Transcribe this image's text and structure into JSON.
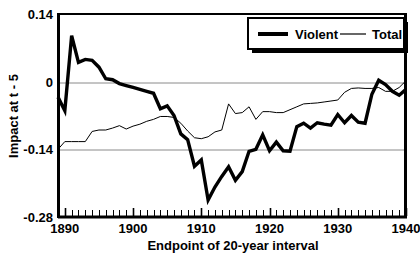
{
  "chart_data": {
    "type": "line",
    "title": "",
    "xlabel": "Endpoint of 20-year interval",
    "ylabel": "Impact at t - 5",
    "xlim": [
      1889,
      1940
    ],
    "ylim": [
      -0.28,
      0.14
    ],
    "xticks": [
      1890,
      1900,
      1910,
      1920,
      1930,
      1940
    ],
    "xtick_labels": [
      "1890",
      "1900",
      "1910",
      "1920",
      "1930",
      "1940"
    ],
    "yticks": [
      0.14,
      0,
      -0.14,
      -0.28
    ],
    "ytick_labels": [
      "0.14",
      "0",
      "-0.14",
      "-0.28"
    ],
    "minor_xtick_step": 1,
    "grid": "horizontal-gridlines-at-0-and--0.14",
    "legend": {
      "position": "top-right",
      "entries": [
        {
          "name": "Violent",
          "style": "thick-black-line",
          "color": "#000000",
          "width": 3.4
        },
        {
          "name": "Total",
          "style": "thin-black-line",
          "color": "#000000",
          "width": 1.0
        }
      ]
    },
    "x": [
      1889,
      1890,
      1891,
      1892,
      1893,
      1894,
      1895,
      1896,
      1897,
      1898,
      1899,
      1900,
      1901,
      1902,
      1903,
      1904,
      1905,
      1906,
      1907,
      1908,
      1909,
      1910,
      1911,
      1912,
      1913,
      1914,
      1915,
      1916,
      1917,
      1918,
      1919,
      1920,
      1921,
      1922,
      1923,
      1924,
      1925,
      1926,
      1927,
      1928,
      1929,
      1930,
      1931,
      1932,
      1933,
      1934,
      1935,
      1936,
      1937,
      1938,
      1939,
      1940
    ],
    "series": [
      {
        "name": "Violent",
        "values": [
          -0.032,
          -0.06,
          0.095,
          0.04,
          0.046,
          0.044,
          0.03,
          0.006,
          0.004,
          -0.004,
          -0.008,
          -0.012,
          -0.016,
          -0.02,
          -0.024,
          -0.056,
          -0.05,
          -0.07,
          -0.108,
          -0.12,
          -0.175,
          -0.162,
          -0.245,
          -0.218,
          -0.196,
          -0.176,
          -0.204,
          -0.186,
          -0.144,
          -0.14,
          -0.11,
          -0.143,
          -0.125,
          -0.143,
          -0.144,
          -0.093,
          -0.086,
          -0.096,
          -0.085,
          -0.088,
          -0.09,
          -0.068,
          -0.085,
          -0.07,
          -0.084,
          -0.086,
          -0.026,
          0.003,
          -0.006,
          -0.02,
          -0.028,
          -0.016
        ]
      },
      {
        "name": "Total",
        "values": [
          -0.14,
          -0.124,
          -0.124,
          -0.124,
          -0.124,
          -0.103,
          -0.1,
          -0.1,
          -0.096,
          -0.091,
          -0.098,
          -0.092,
          -0.088,
          -0.082,
          -0.078,
          -0.072,
          -0.072,
          -0.074,
          -0.086,
          -0.102,
          -0.116,
          -0.118,
          -0.114,
          -0.104,
          -0.1,
          -0.046,
          -0.066,
          -0.064,
          -0.052,
          -0.078,
          -0.062,
          -0.062,
          -0.064,
          -0.064,
          -0.058,
          -0.052,
          -0.046,
          -0.045,
          -0.044,
          -0.042,
          -0.04,
          -0.038,
          -0.022,
          -0.014,
          -0.013,
          -0.014,
          -0.014,
          -0.012,
          -0.02,
          -0.02,
          -0.012,
          0.002
        ]
      }
    ]
  },
  "axes": {
    "y_title": "Impact at t - 5",
    "x_title": "Endpoint of 20-year interval"
  }
}
